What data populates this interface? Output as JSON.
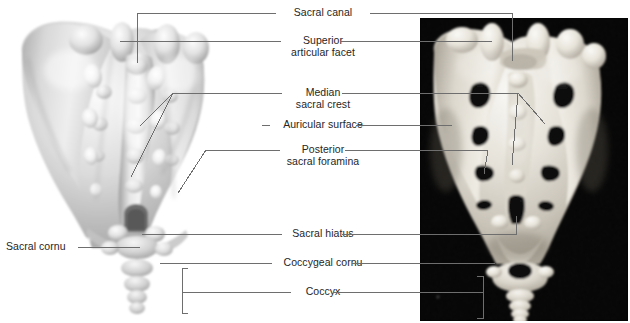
{
  "figure": {
    "panels": [
      {
        "id": "left",
        "name": "illustration-panel",
        "kind": "airbrush illustration",
        "background": "#ffffff"
      },
      {
        "id": "right",
        "name": "photograph-panel",
        "kind": "bone photograph",
        "background": "#000000"
      }
    ],
    "colors": {
      "text": "#262626",
      "leader": "#6e6e6e",
      "bracket": "#6e6e6e",
      "photo_background": "#000000",
      "bone_light": "#f2f0ea",
      "bone_mid": "#cfcac0",
      "bone_shadow": "#8e887e",
      "illus_light": "#f3f3f3",
      "illus_mid": "#cccccc",
      "illus_shadow": "#8f8f8f",
      "page": "#ffffff"
    }
  },
  "labels": {
    "sacral_canal": "Sacral canal",
    "superior_articular_facet_1": "Superior",
    "superior_articular_facet_2": "articular facet",
    "median_sacral_crest_1": "Median",
    "median_sacral_crest_2": "sacral crest",
    "auricular_surface": "Auricular surface",
    "posterior_sacral_foramina_1": "Posterior",
    "posterior_sacral_foramina_2": "sacral foramina",
    "sacral_hiatus": "Sacral hiatus",
    "coccygeal_cornu": "Coccygeal cornu",
    "coccyx": "Coccyx",
    "sacral_cornu": "Sacral cornu"
  }
}
